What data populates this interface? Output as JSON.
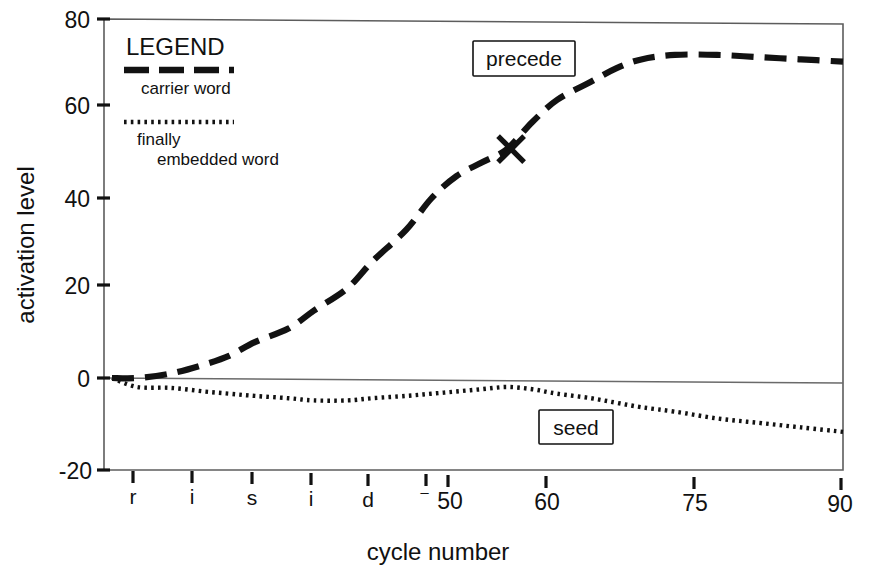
{
  "figure": {
    "background": "#ffffff",
    "ink_color": "#121212",
    "frame_color": "#5d5d5d"
  },
  "axes": {
    "y_title": "activation level",
    "x_title": "cycle number",
    "y_ticks": [
      "80",
      "60",
      "40",
      "20",
      "0",
      "-20"
    ],
    "y_tick_values": [
      80,
      60,
      40,
      20,
      0,
      -20
    ],
    "x_ticks": [
      "r",
      "i",
      "s",
      "i",
      "d",
      "⁻",
      "50",
      "60",
      "75",
      "90"
    ],
    "x_tick_values": [
      10,
      17,
      24,
      31,
      38,
      44,
      50,
      60,
      75,
      90
    ]
  },
  "legend": {
    "title": "LEGEND",
    "entries": [
      {
        "label": "carrier word",
        "style": "dashed"
      },
      {
        "label": "finally",
        "label2": "embedded word",
        "style": "dotted"
      }
    ]
  },
  "annotations": [
    {
      "name": "precede",
      "text": "precede"
    },
    {
      "name": "seed",
      "text": "seed"
    }
  ],
  "marker": {
    "shape": "x-marker",
    "cycle": 50.5,
    "activation": 51
  },
  "chart_data": {
    "type": "line",
    "title": "",
    "subtitle": "",
    "xlabel": "cycle number",
    "ylabel": "activation level",
    "xlim": [
      3,
      90
    ],
    "ylim": [
      -20,
      80
    ],
    "grid": false,
    "legend_position": "upper-left-inside",
    "xtick_labels": [
      "r",
      "i",
      "s",
      "i",
      "d",
      "⁻",
      "50",
      "60",
      "75",
      "90"
    ],
    "xtick_values": [
      10,
      17,
      24,
      31,
      38,
      44,
      50,
      60,
      75,
      90
    ],
    "ytick_values": [
      -20,
      0,
      20,
      40,
      60,
      80
    ],
    "annotations": [
      {
        "text": "precede",
        "x": 52,
        "y": 72,
        "boxed": true
      },
      {
        "text": "seed",
        "x": 59,
        "y": -9,
        "boxed": true
      }
    ],
    "markers": [
      {
        "shape": "x",
        "x": 50.5,
        "y": 51,
        "series": "carrier word"
      }
    ],
    "x": [
      3,
      6,
      10,
      14,
      17,
      20,
      24,
      27,
      31,
      34,
      38,
      41,
      44,
      47,
      50,
      53,
      56,
      60,
      63,
      66,
      70,
      75,
      80,
      85,
      90
    ],
    "series": [
      {
        "name": "carrier word",
        "annotation": "precede",
        "style": "dashed",
        "values": [
          0,
          0,
          1,
          3,
          5,
          8,
          11,
          15,
          20,
          26,
          33,
          40,
          45,
          48,
          51,
          57,
          62,
          66,
          69,
          71,
          72,
          72,
          71.5,
          71,
          70.5
        ]
      },
      {
        "name": "finally embedded word",
        "annotation": "seed",
        "style": "dotted",
        "values": [
          0,
          -2,
          -2.2,
          -3,
          -3.5,
          -4,
          -4.5,
          -5,
          -5,
          -4.5,
          -4,
          -3.5,
          -3,
          -2.5,
          -2,
          -2.5,
          -3.5,
          -4.5,
          -5.5,
          -6.5,
          -7.5,
          -9,
          -10,
          -11,
          -12
        ]
      }
    ]
  }
}
